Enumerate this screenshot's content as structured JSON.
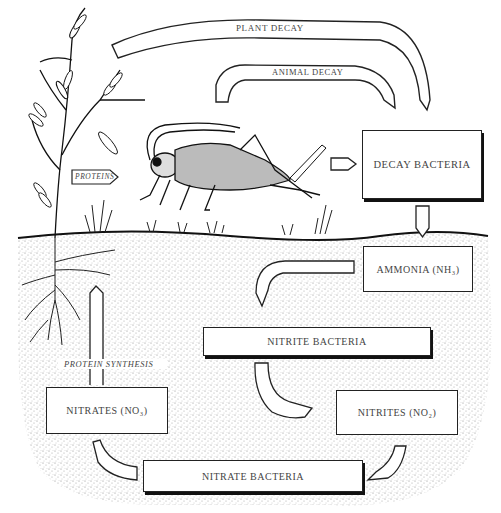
{
  "diagram": {
    "arrows": {
      "plant_decay": "PLANT DECAY",
      "animal_decay": "ANIMAL DECAY",
      "proteins": "PROTEINS",
      "protein_synthesis": "PROTEIN SYNTHESIS"
    },
    "boxes": {
      "decay_bacteria": "DECAY BACTERIA",
      "ammonia": "AMMONIA (NH₃)",
      "nitrite_bacteria": "NITRITE BACTERIA",
      "nitrites": "NITRITES (NO₂)",
      "nitrates": "NITRATES (NO₃)",
      "nitrate_bacteria": "NITRATE BACTERIA"
    },
    "illustrations": [
      "plant-with-roots",
      "cricket",
      "grass-tufts",
      "soil"
    ],
    "colors": {
      "ink": "#222222",
      "paper": "#ffffff",
      "soil_stipple": "#9a9a9a"
    }
  }
}
